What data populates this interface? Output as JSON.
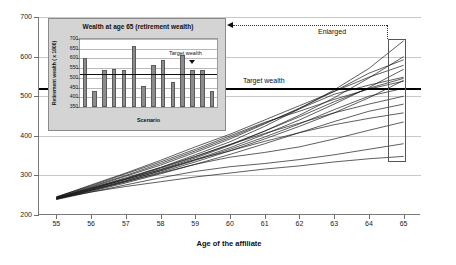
{
  "chart_data": [
    {
      "id": "main",
      "type": "line",
      "title": "",
      "xlabel": "Age of the affiliate",
      "ylabel": "Retirement wealth ( x 1000)",
      "xlim": [
        54.5,
        65.5
      ],
      "ylim": [
        200,
        700
      ],
      "xticks": [
        55,
        56,
        57,
        58,
        59,
        60,
        61,
        62,
        63,
        64,
        65
      ],
      "yticks": [
        200,
        300,
        400,
        500,
        600,
        700
      ],
      "grid": true,
      "legend": "none",
      "annotations": [
        {
          "name": "target-wealth-line",
          "label": "Target wealth",
          "value": 520,
          "style": "thick-black-horizontal-line"
        },
        {
          "name": "enlarged-callout",
          "label": "Enlarged",
          "style": "dotted-arrow-left"
        },
        {
          "name": "source-region-rect",
          "label": "",
          "style": "rectangle-at-age-65"
        }
      ],
      "series": [
        {
          "name": "Scenario 1",
          "x": [
            55,
            56,
            57,
            58,
            59,
            60,
            61,
            62,
            63,
            64,
            65
          ],
          "values": [
            243,
            268,
            292,
            320,
            352,
            385,
            424,
            468,
            516,
            570,
            640
          ]
        },
        {
          "name": "Scenario 2",
          "x": [
            55,
            56,
            57,
            58,
            59,
            60,
            61,
            62,
            63,
            64,
            65
          ],
          "values": [
            242,
            265,
            290,
            315,
            344,
            376,
            412,
            452,
            496,
            546,
            600
          ]
        },
        {
          "name": "Scenario 3",
          "x": [
            55,
            56,
            57,
            58,
            59,
            60,
            61,
            62,
            63,
            64,
            65
          ],
          "values": [
            244,
            270,
            298,
            326,
            358,
            392,
            430,
            470,
            512,
            558,
            592
          ]
        },
        {
          "name": "Scenario 4",
          "x": [
            55,
            56,
            57,
            58,
            59,
            60,
            61,
            62,
            63,
            64,
            65
          ],
          "values": [
            241,
            263,
            286,
            312,
            340,
            370,
            404,
            440,
            480,
            522,
            568
          ]
        },
        {
          "name": "Scenario 5",
          "x": [
            55,
            56,
            57,
            58,
            59,
            60,
            61,
            62,
            63,
            64,
            65
          ],
          "values": [
            245,
            272,
            300,
            330,
            362,
            396,
            432,
            468,
            505,
            528,
            548
          ]
        },
        {
          "name": "Scenario 6",
          "x": [
            55,
            56,
            57,
            58,
            59,
            60,
            61,
            62,
            63,
            64,
            65
          ],
          "values": [
            243,
            266,
            291,
            318,
            347,
            378,
            412,
            448,
            486,
            520,
            545
          ]
        },
        {
          "name": "Scenario 7",
          "x": [
            55,
            56,
            57,
            58,
            59,
            60,
            61,
            62,
            63,
            64,
            65
          ],
          "values": [
            240,
            262,
            284,
            308,
            334,
            362,
            392,
            424,
            458,
            496,
            540
          ]
        },
        {
          "name": "Scenario 8",
          "x": [
            55,
            56,
            57,
            58,
            59,
            60,
            61,
            62,
            63,
            64,
            65
          ],
          "values": [
            246,
            274,
            304,
            334,
            366,
            400,
            434,
            462,
            492,
            518,
            538
          ]
        },
        {
          "name": "Scenario 9",
          "x": [
            55,
            56,
            57,
            58,
            59,
            60,
            61,
            62,
            63,
            64,
            65
          ],
          "values": [
            242,
            264,
            287,
            311,
            338,
            366,
            397,
            430,
            466,
            500,
            520
          ]
        },
        {
          "name": "Scenario 10",
          "x": [
            55,
            56,
            57,
            58,
            59,
            60,
            61,
            62,
            63,
            64,
            65
          ],
          "values": [
            244,
            268,
            294,
            320,
            348,
            378,
            406,
            432,
            458,
            480,
            500
          ]
        },
        {
          "name": "Scenario 11",
          "x": [
            55,
            56,
            57,
            58,
            59,
            60,
            61,
            62,
            63,
            64,
            65
          ],
          "values": [
            240,
            260,
            281,
            304,
            328,
            353,
            380,
            408,
            436,
            462,
            480
          ]
        },
        {
          "name": "Scenario 12",
          "x": [
            55,
            56,
            57,
            58,
            59,
            60,
            61,
            62,
            63,
            64,
            65
          ],
          "values": [
            243,
            267,
            290,
            314,
            340,
            362,
            386,
            408,
            428,
            444,
            458
          ]
        },
        {
          "name": "Scenario 13",
          "x": [
            55,
            56,
            57,
            58,
            59,
            60,
            61,
            62,
            63,
            64,
            65
          ],
          "values": [
            241,
            262,
            284,
            306,
            328,
            346,
            358,
            372,
            392,
            414,
            435
          ]
        },
        {
          "name": "Scenario 14",
          "x": [
            55,
            56,
            57,
            58,
            59,
            60,
            61,
            62,
            63,
            64,
            65
          ],
          "values": [
            239,
            258,
            276,
            294,
            310,
            322,
            330,
            340,
            352,
            366,
            380
          ]
        },
        {
          "name": "Scenario 15",
          "x": [
            55,
            56,
            57,
            58,
            59,
            60,
            61,
            62,
            63,
            64,
            65
          ],
          "values": [
            242,
            258,
            272,
            284,
            296,
            306,
            316,
            324,
            334,
            342,
            348
          ]
        },
        {
          "name": "Scenario 16",
          "x": [
            55,
            56,
            57,
            58,
            59,
            60,
            61,
            62,
            63,
            64,
            65
          ],
          "values": [
            245,
            276,
            306,
            338,
            372,
            404,
            440,
            476,
            512,
            548,
            578
          ]
        }
      ]
    },
    {
      "id": "inset",
      "type": "bar",
      "title": "Wealth at age 65 (retirement wealth)",
      "xlabel": "Scenario",
      "ylabel": "Retirement wealth ( x 1000)",
      "ylim": [
        350,
        700
      ],
      "yticks": [
        350,
        400,
        450,
        500,
        550,
        600,
        650,
        700
      ],
      "grid": true,
      "legend": "none",
      "categories": [
        "1",
        "2",
        "3",
        "4",
        "5",
        "6",
        "7",
        "8",
        "9",
        "10",
        "11",
        "12",
        "13",
        "14"
      ],
      "values": [
        600,
        435,
        540,
        548,
        540,
        665,
        458,
        568,
        592,
        480,
        618,
        538,
        540,
        432
      ],
      "annotations": [
        {
          "name": "inset-target-wealth-line",
          "label": "Target wealth",
          "value": 520,
          "style": "horizontal-line-with-arrow"
        }
      ]
    }
  ],
  "main_chart": {
    "yaxis_title": "Retirement wealth ( x 1000)",
    "xaxis_title": "Age of the affiliate",
    "ytick_labels": [
      "700",
      "600",
      "500",
      "400",
      "300",
      "200"
    ],
    "xtick_labels": [
      "55",
      "56",
      "57",
      "58",
      "59",
      "60",
      "61",
      "62",
      "63",
      "64",
      "65"
    ],
    "target_label": "Target wealth",
    "enlarged_label": "Enlarged"
  },
  "inset_chart": {
    "title": "Wealth at age 65 (retirement wealth)",
    "yaxis_title": "Retirement wealth ( x 1000)",
    "xaxis_title": "Scenario",
    "ytick_labels": [
      "700",
      "650",
      "600",
      "550",
      "500",
      "450",
      "400",
      "350"
    ],
    "target_label": "Target wealth"
  },
  "colors": {
    "background": "#ffffff",
    "inset_panel": "#d4d4d4",
    "bar_fill": "#8c8c8c",
    "bar_stroke": "#5a5a5a",
    "curve": "#1a1a1a",
    "gridline": "#c8c8c8",
    "target_line": "#000000"
  }
}
